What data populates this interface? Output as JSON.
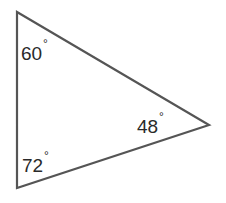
{
  "diagram": {
    "type": "triangle",
    "stroke_color": "#555555",
    "angles": [
      {
        "vertex": "top-left",
        "value": "60",
        "unit": "°"
      },
      {
        "vertex": "right",
        "value": "48",
        "unit": "°"
      },
      {
        "vertex": "bottom-left",
        "value": "72",
        "unit": "°"
      }
    ]
  }
}
